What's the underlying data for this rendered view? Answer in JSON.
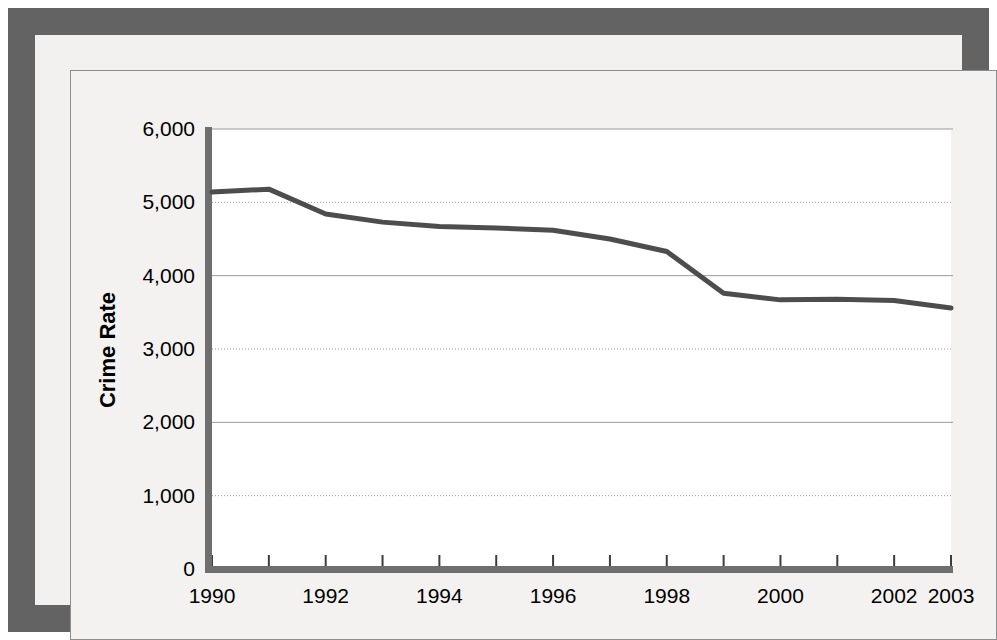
{
  "figure": {
    "frame_color": "#636363",
    "canvas_color": "#f3f2f0",
    "plot_area_color": "#ffffff",
    "series_color": "#4d4d4d",
    "gridline_color": "#9a9a9a",
    "axis_color": "#6e6e6e"
  },
  "chart_data": {
    "type": "line",
    "title": "",
    "xlabel": "",
    "ylabel": "Crime Rate",
    "x": [
      1990,
      1991,
      1992,
      1993,
      1994,
      1995,
      1996,
      1997,
      1998,
      1999,
      2000,
      2001,
      2002,
      2003
    ],
    "values": [
      5140,
      5180,
      4840,
      4730,
      4670,
      4650,
      4620,
      4500,
      4330,
      3760,
      3670,
      3680,
      3660,
      3560
    ],
    "series": [
      {
        "name": "Crime Rate",
        "values": [
          5140,
          5180,
          4840,
          4730,
          4670,
          4650,
          4620,
          4500,
          4330,
          3760,
          3670,
          3680,
          3660,
          3560
        ]
      }
    ],
    "xlim": [
      1990,
      2003
    ],
    "ylim": [
      0,
      6000
    ],
    "ytick_values": [
      0,
      1000,
      2000,
      3000,
      4000,
      5000,
      6000
    ],
    "ytick_labels": [
      "0",
      "1,000",
      "2,000",
      "3,000",
      "4,000",
      "5,000",
      "6,000"
    ],
    "xtick_values": [
      1990,
      1991,
      1992,
      1993,
      1994,
      1995,
      1996,
      1997,
      1998,
      1999,
      2000,
      2001,
      2002,
      2003
    ],
    "xtick_labels": [
      "1990",
      "",
      "1992",
      "",
      "1994",
      "",
      "1996",
      "",
      "1998",
      "",
      "2000",
      "",
      "2002",
      "2003"
    ],
    "grid": true,
    "grid_axis": "y",
    "legend": false,
    "legend_position": "none",
    "markers": false,
    "line_width": 5
  }
}
